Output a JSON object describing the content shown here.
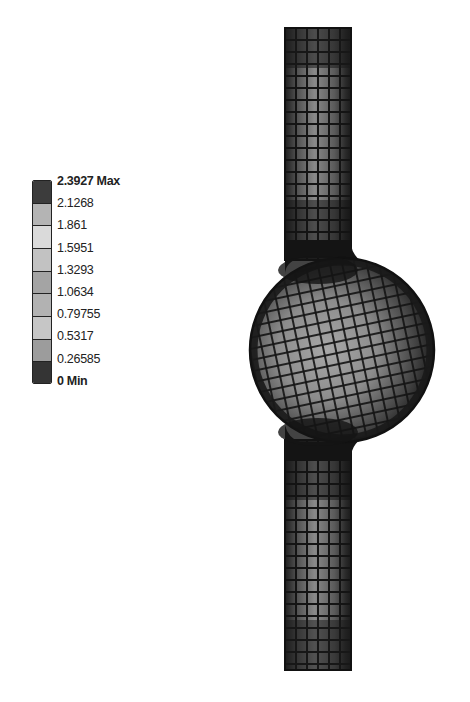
{
  "legend": {
    "labels": [
      "2.3927 Max",
      "2.1268",
      "1.861",
      "1.5951",
      "1.3293",
      "1.0634",
      "0.79755",
      "0.5317",
      "0.26585",
      "0 Min"
    ],
    "max_label": "2.3927 Max",
    "min_label": "0 Min",
    "band_colors": [
      "#3c3c3c",
      "#b4b4b4",
      "#dadada",
      "#c2c2c2",
      "#a4a4a4",
      "#b2b2b2",
      "#c6c6c6",
      "#9c9c9c",
      "#343434"
    ]
  },
  "model": {
    "description": "FEA mesh of tube with spherical bulge (contour plot)",
    "mesh_color": "#141414"
  }
}
